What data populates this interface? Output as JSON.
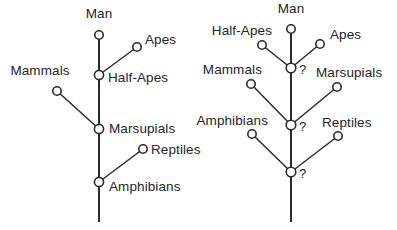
{
  "figure": {
    "background_color": "#ffffff",
    "line_color": "#2b2b2b",
    "text_color": "#24242a",
    "node_fill": "#ffffff"
  },
  "diagrams": [
    {
      "id": "left-tree",
      "name": "left-evolutionary-tree",
      "trunk": {
        "x": 99,
        "y_top": 35,
        "y_bottom": 222
      },
      "nodes": [
        {
          "id": "man",
          "label": "Man",
          "cx": 99,
          "cy": 35,
          "r": 4.2,
          "label_x": 99,
          "label_y": 18,
          "anchor": "middle"
        },
        {
          "id": "apes",
          "label": "Apes",
          "cx": 137,
          "cy": 47,
          "r": 4.2,
          "label_x": 145,
          "label_y": 44,
          "anchor": "start"
        },
        {
          "id": "half-apes",
          "label": "Half-Apes",
          "cx": 99,
          "cy": 75,
          "r": 4.6,
          "label_x": 108,
          "label_y": 82,
          "anchor": "start"
        },
        {
          "id": "mammals",
          "label": "Mammals",
          "cx": 57,
          "cy": 91,
          "r": 4.2,
          "label_x": 40,
          "label_y": 75,
          "anchor": "middle"
        },
        {
          "id": "marsupials",
          "label": "Marsupials",
          "cx": 99,
          "cy": 129,
          "r": 4.6,
          "label_x": 109,
          "label_y": 133,
          "anchor": "start"
        },
        {
          "id": "reptiles",
          "label": "Reptiles",
          "cx": 143,
          "cy": 149,
          "r": 4.2,
          "label_x": 151,
          "label_y": 154,
          "anchor": "start"
        },
        {
          "id": "amphibians",
          "label": "Amphibians",
          "cx": 99,
          "cy": 182,
          "r": 4.6,
          "label_x": 109,
          "label_y": 191,
          "anchor": "start"
        }
      ],
      "branches": [
        {
          "from": "half-apes",
          "to": "apes"
        },
        {
          "from": "marsupials",
          "to": "mammals"
        },
        {
          "from": "amphibians",
          "to": "reptiles"
        }
      ],
      "queries": []
    },
    {
      "id": "right-tree",
      "name": "right-evolutionary-tree",
      "trunk": {
        "x": 291,
        "y_top": 29,
        "y_bottom": 222
      },
      "nodes": [
        {
          "id": "man-r",
          "label": "Man",
          "cx": 291,
          "cy": 29,
          "r": 4.2,
          "label_x": 291,
          "label_y": 13,
          "anchor": "middle"
        },
        {
          "id": "half-apes-r",
          "label": "Half-Apes",
          "cx": 262,
          "cy": 45,
          "r": 4.2,
          "label_x": 272,
          "label_y": 35,
          "anchor": "end"
        },
        {
          "id": "apes-r",
          "label": "Apes",
          "cx": 320,
          "cy": 44,
          "r": 4.2,
          "label_x": 330,
          "label_y": 39,
          "anchor": "start"
        },
        {
          "id": "junction-1",
          "label": "",
          "cx": 291,
          "cy": 68,
          "r": 4.8,
          "label_x": 0,
          "label_y": 0,
          "anchor": "start"
        },
        {
          "id": "mammals-r",
          "label": "Mammals",
          "cx": 251,
          "cy": 84,
          "r": 4.2,
          "label_x": 262,
          "label_y": 74,
          "anchor": "end"
        },
        {
          "id": "marsupials-r",
          "label": "Marsupials",
          "cx": 337,
          "cy": 87,
          "r": 4.2,
          "label_x": 316,
          "label_y": 77,
          "anchor": "start"
        },
        {
          "id": "junction-2",
          "label": "",
          "cx": 291,
          "cy": 125,
          "r": 4.8,
          "label_x": 0,
          "label_y": 0,
          "anchor": "start"
        },
        {
          "id": "amphibians-r",
          "label": "Amphibians",
          "cx": 252,
          "cy": 134,
          "r": 4.2,
          "label_x": 268,
          "label_y": 125,
          "anchor": "end"
        },
        {
          "id": "reptiles-r",
          "label": "Reptiles",
          "cx": 338,
          "cy": 136,
          "r": 4.2,
          "label_x": 322,
          "label_y": 127,
          "anchor": "start"
        },
        {
          "id": "junction-3",
          "label": "",
          "cx": 291,
          "cy": 172,
          "r": 4.8,
          "label_x": 0,
          "label_y": 0,
          "anchor": "start"
        }
      ],
      "branches": [
        {
          "from": "junction-1",
          "to": "half-apes-r"
        },
        {
          "from": "junction-1",
          "to": "apes-r"
        },
        {
          "from": "junction-2",
          "to": "mammals-r"
        },
        {
          "from": "junction-2",
          "to": "marsupials-r"
        },
        {
          "from": "junction-3",
          "to": "amphibians-r"
        },
        {
          "from": "junction-3",
          "to": "reptiles-r"
        }
      ],
      "queries": [
        {
          "id": "query-1",
          "text": "?",
          "x": 299,
          "y": 74
        },
        {
          "id": "query-2",
          "text": "?",
          "x": 299,
          "y": 131
        },
        {
          "id": "query-3",
          "text": "?",
          "x": 299,
          "y": 178
        }
      ]
    }
  ]
}
